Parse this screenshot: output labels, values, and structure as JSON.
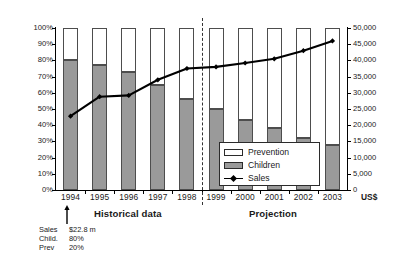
{
  "chart_data": {
    "type": "bar",
    "title": "",
    "subtitle": "",
    "xlabel": "",
    "ylabel": "",
    "y2label": "US$",
    "grid": false,
    "legend_position": "inside-bottom-right",
    "categories": [
      "1994",
      "1995",
      "1996",
      "1997",
      "1998",
      "1999",
      "2000",
      "2001",
      "2002",
      "2003"
    ],
    "ylim": [
      0,
      100
    ],
    "y2lim": [
      0,
      50000
    ],
    "y_ticks": [
      "0%",
      "10%",
      "20%",
      "30%",
      "40%",
      "50%",
      "60%",
      "70%",
      "80%",
      "90%",
      "100%"
    ],
    "y2_ticks": [
      "0",
      "5,000",
      "10,000",
      "15,000",
      "20,000",
      "25,000",
      "30,000",
      "35,000",
      "40,000",
      "45,000",
      "50,000"
    ],
    "stacked": true,
    "series": [
      {
        "name": "Children",
        "axis": "left",
        "kind": "bar",
        "color": "#9a9a9a",
        "values": [
          80,
          77,
          73,
          65,
          56,
          50,
          43,
          38,
          32,
          28
        ]
      },
      {
        "name": "Prevention",
        "axis": "left",
        "kind": "bar",
        "color": "#ffffff",
        "values": [
          20,
          23,
          27,
          35,
          44,
          50,
          57,
          62,
          68,
          72
        ]
      },
      {
        "name": "Sales",
        "axis": "right",
        "kind": "line",
        "color": "#000000",
        "values": [
          22800,
          28800,
          29200,
          34000,
          37500,
          38000,
          39200,
          40500,
          43000,
          46000
        ]
      }
    ],
    "annotations": [
      {
        "name": "historical-section",
        "text": "Historical data",
        "span": [
          "1994",
          "1998"
        ]
      },
      {
        "name": "projection-section",
        "text": "Projection",
        "span": [
          "1999",
          "2003"
        ]
      },
      {
        "name": "divider",
        "text": "",
        "between": [
          "1998",
          "1999"
        ],
        "style": "dashed-vertical"
      }
    ],
    "callout": {
      "target_category": "1994",
      "rows": [
        {
          "key": "Sales",
          "value": "$22.8 m"
        },
        {
          "key": "Child.",
          "value": "80%"
        },
        {
          "key": "Prev",
          "value": "20%"
        }
      ]
    }
  },
  "axes": {
    "left": {
      "ticks": [
        "100%",
        "90%",
        "80%",
        "70%",
        "60%",
        "50%",
        "40%",
        "30%",
        "20%",
        "10%",
        "0%"
      ]
    },
    "right": {
      "ticks": [
        "50,000",
        "45,000",
        "40,000",
        "35,000",
        "30,000",
        "25,000",
        "20,000",
        "15,000",
        "10,000",
        "5,000",
        "0"
      ],
      "unit_label": "US$"
    },
    "bottom": {
      "ticks": [
        "1994",
        "1995",
        "1996",
        "1997",
        "1998",
        "1999",
        "2000",
        "2001",
        "2002",
        "2003"
      ]
    }
  },
  "legend": {
    "items": [
      {
        "label": "Prevention",
        "swatch": "open-rect-swatch"
      },
      {
        "label": "Children",
        "swatch": "filled-rect-swatch"
      },
      {
        "label": "Sales",
        "swatch": "line-marker-swatch"
      }
    ]
  },
  "sections": {
    "historical_label": "Historical data",
    "projection_label": "Projection"
  },
  "callout": {
    "rows": [
      {
        "key": "Sales",
        "value": "$22.8 m"
      },
      {
        "key": "Child.",
        "value": "80%"
      },
      {
        "key": "Prev",
        "value": "20%"
      }
    ]
  },
  "colors": {
    "children_fill": "#9a9a9a",
    "prevention_fill": "#ffffff",
    "bar_stroke": "#4d4d4d",
    "sales_line": "#000000",
    "axis": "#000000"
  }
}
